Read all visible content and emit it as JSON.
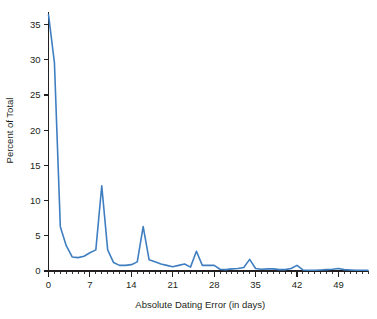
{
  "chart_data": {
    "type": "line",
    "title": "",
    "xlabel": "Absolute Dating Error (in days)",
    "ylabel": "Percent of Total",
    "xlim": [
      0,
      54
    ],
    "ylim": [
      0,
      36.5
    ],
    "grid": false,
    "legend": null,
    "line_color": "#3f7fc1",
    "xticks": [
      0,
      7,
      14,
      21,
      28,
      35,
      42,
      49
    ],
    "xtick_labels": [
      "0",
      "7",
      "14",
      "21",
      "28",
      "35",
      "42",
      "49"
    ],
    "xminor_step": 1,
    "yticks": [
      0,
      5,
      10,
      15,
      20,
      25,
      30,
      35
    ],
    "ytick_labels": [
      "0",
      "5",
      "10",
      "15",
      "20",
      "25",
      "30",
      "35"
    ],
    "x": [
      0,
      1,
      2,
      3,
      4,
      5,
      6,
      7,
      8,
      9,
      10,
      11,
      12,
      13,
      14,
      15,
      16,
      17,
      18,
      19,
      20,
      21,
      22,
      23,
      24,
      25,
      26,
      27,
      28,
      29,
      30,
      31,
      32,
      33,
      34,
      35,
      36,
      37,
      38,
      39,
      40,
      41,
      42,
      43,
      44,
      45,
      46,
      47,
      48,
      49,
      50,
      51,
      52,
      53,
      54
    ],
    "values": [
      36.4,
      29.6,
      6.3,
      3.6,
      2.0,
      1.9,
      2.1,
      2.6,
      3.0,
      12.1,
      3.0,
      1.2,
      0.8,
      0.8,
      0.9,
      1.3,
      6.3,
      1.6,
      1.3,
      1.0,
      0.8,
      0.6,
      0.8,
      1.0,
      0.55,
      2.8,
      0.8,
      0.8,
      0.8,
      0.25,
      0.2,
      0.3,
      0.35,
      0.5,
      1.65,
      0.35,
      0.25,
      0.3,
      0.3,
      0.2,
      0.2,
      0.35,
      0.8,
      0.15,
      0.1,
      0.1,
      0.15,
      0.2,
      0.25,
      0.35,
      0.2,
      0.15,
      0.1,
      0.1,
      0.1
    ],
    "peaks": [
      {
        "x": 0,
        "y": 36.4,
        "note": "initial spike near zero error"
      },
      {
        "x": 7,
        "y": 12.1,
        "note": "one-week multiple"
      },
      {
        "x": 14,
        "y": 6.3,
        "note": "two-week multiple"
      },
      {
        "x": 21,
        "y": 2.8,
        "note": "three-week multiple"
      },
      {
        "x": 28,
        "y": 1.65,
        "note": "four-week multiple"
      },
      {
        "x": 35,
        "y": 0.8,
        "note": "five-week multiple"
      },
      {
        "x": 42,
        "y": 0.35,
        "note": "six-week multiple"
      }
    ]
  }
}
